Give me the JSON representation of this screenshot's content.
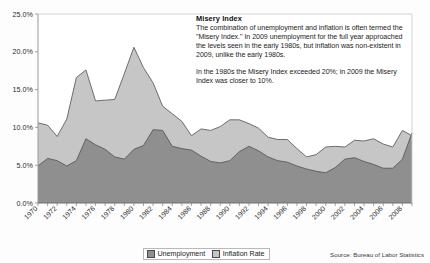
{
  "annotation": {
    "title": "Misery Index",
    "paragraph1": "The combination of unemployment and inflation is often termed the \"Misery Index.\"  In 2009 unemployment for the full year approached the levels seen in the early 1980s, but inflation was non-existent in 2009, unlike the early 1980s.",
    "paragraph2": "In the 1980s the Misery Index exceeded 20%; in 2009 the Misery Index was closer to 10%."
  },
  "source_note": "Source: Bureau of Labor Statistics",
  "legend": {
    "items": [
      {
        "label": "Unemployment",
        "color": "#8f8f8f"
      },
      {
        "label": "Inflation Rate",
        "color": "#c6c6c6"
      }
    ]
  },
  "chart_data": {
    "type": "area",
    "stacked": true,
    "title": "",
    "xlabel": "",
    "ylabel": "",
    "ylim": [
      0,
      25
    ],
    "ytick_labels": [
      "0.0%",
      "5.0%",
      "10.0%",
      "15.0%",
      "20.0%",
      "25.0%"
    ],
    "ytick_values": [
      0,
      5,
      10,
      15,
      20,
      25
    ],
    "grid": false,
    "legend_position": "bottom",
    "x": [
      1970,
      1971,
      1972,
      1973,
      1974,
      1975,
      1976,
      1977,
      1978,
      1979,
      1980,
      1981,
      1982,
      1983,
      1984,
      1985,
      1986,
      1987,
      1988,
      1989,
      1990,
      1991,
      1992,
      1993,
      1994,
      1995,
      1996,
      1997,
      1998,
      1999,
      2000,
      2001,
      2002,
      2003,
      2004,
      2005,
      2006,
      2007,
      2008,
      2009
    ],
    "xtick_labels": [
      "1970",
      "1972",
      "1974",
      "1976",
      "1978",
      "1980",
      "1982",
      "1984",
      "1986",
      "1988",
      "1990",
      "1992",
      "1994",
      "1996",
      "1998",
      "2000",
      "2002",
      "2004",
      "2006",
      "2008"
    ],
    "series": [
      {
        "name": "Unemployment",
        "color": "#8f8f8f",
        "values": [
          4.9,
          5.9,
          5.6,
          4.9,
          5.6,
          8.5,
          7.7,
          7.1,
          6.1,
          5.8,
          7.1,
          7.6,
          9.7,
          9.6,
          7.5,
          7.2,
          7.0,
          6.2,
          5.5,
          5.3,
          5.6,
          6.8,
          7.5,
          6.9,
          6.1,
          5.6,
          5.4,
          4.9,
          4.5,
          4.2,
          4.0,
          4.7,
          5.8,
          6.0,
          5.5,
          5.1,
          4.6,
          4.6,
          5.8,
          9.3
        ]
      },
      {
        "name": "Inflation Rate",
        "color": "#c6c6c6",
        "values": [
          5.7,
          4.4,
          3.2,
          6.2,
          11.0,
          9.1,
          5.8,
          6.5,
          7.6,
          11.3,
          13.5,
          10.3,
          6.2,
          3.2,
          4.3,
          3.6,
          1.9,
          3.6,
          4.1,
          4.8,
          5.4,
          4.2,
          3.0,
          3.0,
          2.6,
          2.8,
          3.0,
          2.3,
          1.6,
          2.2,
          3.4,
          2.8,
          1.6,
          2.3,
          2.7,
          3.4,
          3.2,
          2.8,
          3.8,
          -0.4
        ]
      }
    ]
  }
}
